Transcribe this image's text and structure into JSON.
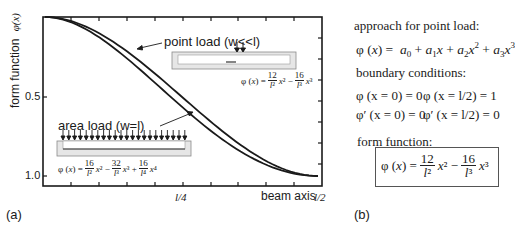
{
  "chart_data": {
    "type": "line",
    "title": "",
    "xlabel": "beam axis",
    "ylabel": "form function φ(x)",
    "x_tick_labels": [
      "l/4",
      "l/2"
    ],
    "y_tick_labels": [
      "0.5",
      "1.0"
    ],
    "ylim": [
      0,
      1.0
    ],
    "y_inverted": true,
    "xlim": [
      "0",
      "l/2"
    ],
    "grid": false,
    "legend": "annotations",
    "x": [
      0,
      0.05,
      0.1,
      0.15,
      0.2,
      0.25,
      0.3,
      0.35,
      0.4,
      0.45,
      0.5
    ],
    "series": [
      {
        "name": "point load (w<<l)",
        "formula": "φ(x) = 12/l² x² − 16/l³ x³",
        "values": [
          0,
          0.028,
          0.104,
          0.216,
          0.352,
          0.5,
          0.648,
          0.784,
          0.896,
          0.972,
          1.0
        ]
      },
      {
        "name": "area load (w=l)",
        "formula": "φ(x) = 16/l² x² − 32/l³ x³ + 16/l⁴ x⁴",
        "values": [
          0,
          0.036,
          0.13,
          0.265,
          0.41,
          0.5625,
          0.706,
          0.828,
          0.922,
          0.98,
          1.0
        ]
      }
    ]
  },
  "panel_a": {
    "label": "(a)",
    "y_axis_label": "form function",
    "y_axis_symbol": "φ(x)",
    "y_ticks": [
      "0.5",
      "1.0"
    ],
    "x_ticks": [
      "l/4",
      "l/2"
    ],
    "x_axis_label": "beam axis",
    "point_load_label": "point load (w<<l)",
    "point_load_formula": "φ (x) = 12/l² x² − 16/l³ x³",
    "area_load_label": "area load (w=l)",
    "area_load_formula": "φ (x) = 16/l² x² − 32/l³ x³ + 16/l⁴ x⁴"
  },
  "panel_b": {
    "label": "(b)",
    "approach_heading": "approach for point load:",
    "approach_formula": "φ (x) = a₀ + a₁x + a₂x² + a₃x³",
    "boundary_heading": "boundary conditions:",
    "bc": [
      "φ (x = 0) = 0",
      "φ (x = l/2) = 1",
      "φ′ (x = 0) = 0",
      "φ′ (x = l/2) = 0"
    ],
    "form_heading": "form function:",
    "form_formula": "φ (x) = 12/l² x² − 16/l³ x³"
  },
  "colors": {
    "line": "#1a1a1a",
    "beam_fill": "#d9d9d9",
    "beam_stroke": "#8a8a8a"
  }
}
